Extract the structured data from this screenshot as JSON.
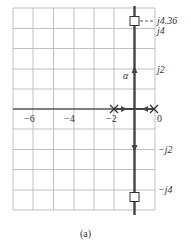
{
  "figure": {
    "caption": "(a)",
    "type": "root-locus",
    "real_axis_ticks": [
      {
        "value": -6,
        "label": "−6"
      },
      {
        "value": -4,
        "label": "−4"
      },
      {
        "value": -2,
        "label": "−2"
      },
      {
        "value": 0,
        "label": "0"
      }
    ],
    "imag_axis_ticks": [
      {
        "value": 4.36,
        "label": "j4.36"
      },
      {
        "value": 4,
        "label": "j4"
      },
      {
        "value": 2,
        "label": "j2"
      },
      {
        "value": -2,
        "label": "−j2"
      },
      {
        "value": -4,
        "label": "−j4"
      }
    ],
    "poles": [
      {
        "re": -2,
        "im": 0,
        "marker": "x"
      },
      {
        "re": 0,
        "im": 0,
        "marker": "x"
      }
    ],
    "end_points": [
      {
        "re": -1,
        "im": 4.36,
        "marker": "square"
      },
      {
        "re": -1,
        "im": -4.36,
        "marker": "square"
      }
    ],
    "branch_label": "α",
    "colors": {
      "grid": "#bbbbbb",
      "axis": "#555555",
      "locus": "#444444"
    }
  }
}
